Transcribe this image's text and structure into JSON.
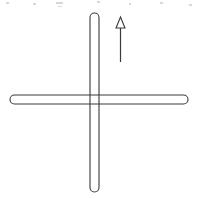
{
  "figure": {
    "title": "Cross shape with upward direction arrow",
    "background_color": "#ffffff",
    "stroke_color": "#3a3a3a",
    "width": 197,
    "height": 199
  },
  "chart_data": {
    "type": "diagram",
    "title": "Cross shape with upward direction arrow",
    "xlabel": "",
    "ylabel": "",
    "shapes": [
      {
        "name": "vertical-bar",
        "kind": "capsule",
        "orientation": "vertical",
        "x_center": 94.5,
        "y_start": 13,
        "y_end": 192,
        "thickness": 9,
        "cap": "round",
        "fill": "none",
        "stroke": "#3a3a3a"
      },
      {
        "name": "horizontal-bar",
        "kind": "capsule",
        "orientation": "horizontal",
        "y_center": 99.5,
        "x_start": 10,
        "x_end": 188,
        "thickness": 9,
        "cap": "round",
        "fill": "none",
        "stroke": "#3a3a3a"
      }
    ],
    "annotations": [
      {
        "name": "direction-arrow",
        "kind": "arrow",
        "direction": "up",
        "x": 120,
        "y_tail": 62,
        "y_tip": 17,
        "head_width": 9,
        "head_length": 11,
        "head_style": "open-triangle",
        "stroke": "#3a3a3a",
        "label": ""
      }
    ],
    "legend": [],
    "grid": false
  },
  "artifacts": {
    "label": "scan specks along the top edge",
    "specks": [
      {
        "x": 6,
        "y": 2,
        "w": 3,
        "h": 2
      },
      {
        "x": 33,
        "y": 3,
        "w": 3,
        "h": 2
      },
      {
        "x": 56,
        "y": 2,
        "w": 7,
        "h": 2
      },
      {
        "x": 58,
        "y": 6,
        "w": 4,
        "h": 1
      },
      {
        "x": 97,
        "y": 1,
        "w": 3,
        "h": 2
      },
      {
        "x": 129,
        "y": 3,
        "w": 2,
        "h": 2
      },
      {
        "x": 160,
        "y": 2,
        "w": 3,
        "h": 2
      },
      {
        "x": 189,
        "y": 4,
        "w": 3,
        "h": 2
      }
    ]
  }
}
